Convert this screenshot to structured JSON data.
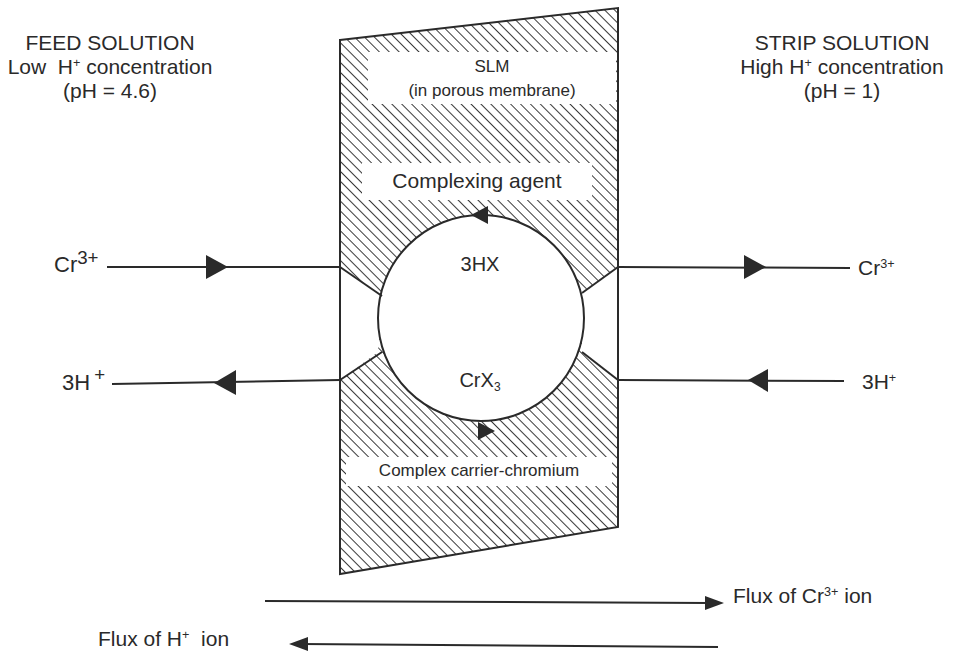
{
  "feed": {
    "title": "FEED SOLUTION",
    "conc_prefix": "Low  H",
    "conc_sup": "+",
    "conc_suffix": " concentration",
    "ph": "(pH = 4.6)"
  },
  "strip": {
    "title": "STRIP SOLUTION",
    "conc_prefix": "High H",
    "conc_sup": "+",
    "conc_suffix": " concentration",
    "ph": "(pH = 1)"
  },
  "membrane": {
    "title": "SLM",
    "subtitle": "(in porous membrane)",
    "agent_label": "Complexing agent",
    "complex_label": "Complex carrier-chromium",
    "top_species": "3HX",
    "bottom_species_base": "CrX",
    "bottom_species_sub": "3",
    "hatch_color": "#3a3a3a",
    "line_color": "#2a2a2a"
  },
  "left_species": {
    "cr_base": "Cr",
    "cr_sup": "3+",
    "h_base": "3H",
    "h_sup": "+"
  },
  "right_species": {
    "cr_base": "Cr",
    "cr_sup": "3+",
    "h_base": "3H",
    "h_sup": "+"
  },
  "flux": {
    "cr_prefix": "Flux of Cr",
    "cr_sup": "3+",
    "cr_suffix": " ion",
    "h_prefix": "Flux of H",
    "h_sup": "+",
    "h_suffix": "  ion"
  }
}
